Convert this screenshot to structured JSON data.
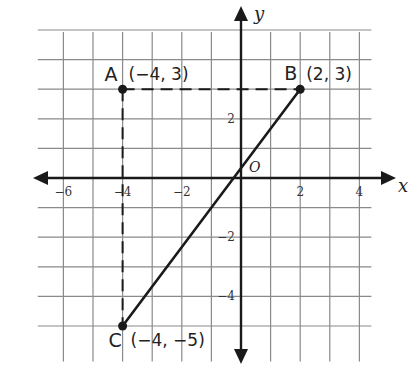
{
  "diagram": {
    "type": "coordinate-plane",
    "grid": {
      "x_min": -7,
      "x_max": 4,
      "y_min": -6,
      "y_max": 5,
      "origin_px": [
        241,
        178
      ],
      "unit_px": 29.6
    },
    "axes": {
      "x_label": "x",
      "y_label": "y",
      "origin_label": "O",
      "x_ticks": [
        {
          "value": -6,
          "label": "−6"
        },
        {
          "value": -4,
          "label": "−4"
        },
        {
          "value": -2,
          "label": "−2"
        },
        {
          "value": 2,
          "label": "2"
        },
        {
          "value": 4,
          "label": "4"
        }
      ],
      "y_ticks": [
        {
          "value": 2,
          "label": "2"
        },
        {
          "value": -2,
          "label": "−2"
        },
        {
          "value": -4,
          "label": "−4"
        }
      ]
    },
    "points": [
      {
        "name": "A",
        "x": -4,
        "y": 3,
        "coord_label": "(−4, 3)"
      },
      {
        "name": "B",
        "x": 2,
        "y": 3,
        "coord_label": "(2, 3)"
      },
      {
        "name": "C",
        "x": -4,
        "y": -5,
        "coord_label": "(−4, −5)"
      }
    ],
    "segments": [
      {
        "from": "C",
        "to": "B",
        "style": "solid"
      },
      {
        "from": "A",
        "to": "B",
        "style": "dashed"
      },
      {
        "from": "A",
        "to": "C",
        "style": "dashed"
      }
    ],
    "colors": {
      "ink": "#1a1a1a",
      "grid": "#8a8a8a",
      "background": "#ffffff"
    }
  }
}
